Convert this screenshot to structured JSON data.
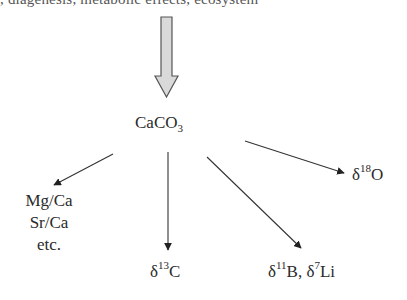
{
  "header": {
    "cropped_text": ", diagenesis, metabolic effects, ecosystem"
  },
  "diagram": {
    "source": {
      "label_main": "CaCO",
      "label_sub": "3"
    },
    "inflow_arrow": {
      "style": "block",
      "fill": "#d9d9d9",
      "stroke": "#555555"
    },
    "outputs": [
      {
        "id": "trace-elements",
        "lines": [
          "Mg/Ca",
          "Sr/Ca",
          "etc."
        ]
      },
      {
        "id": "carbon-isotope",
        "prefix": "δ",
        "sup": "13",
        "element": "C"
      },
      {
        "id": "boron-lithium-isotopes",
        "prefix1": "δ",
        "sup1": "11",
        "element1": "B, ",
        "prefix2": "δ",
        "sup2": "7",
        "element2": "Li"
      },
      {
        "id": "oxygen-isotope",
        "prefix": "δ",
        "sup": "18",
        "element": "O"
      }
    ],
    "colors": {
      "text": "#2a2a2a",
      "arrow": "#333333",
      "block_arrow_fill": "#d9d9d9",
      "block_arrow_stroke": "#555555"
    }
  }
}
